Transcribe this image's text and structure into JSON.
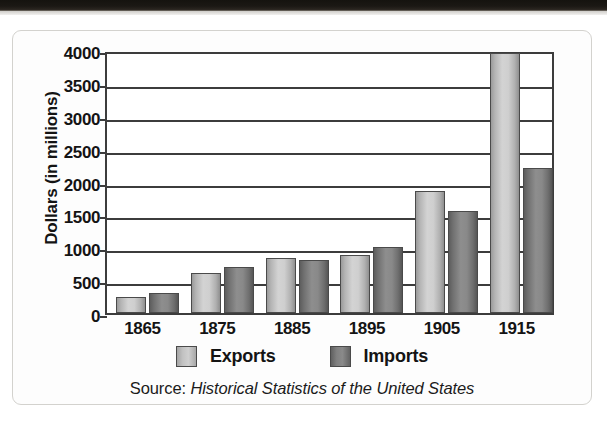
{
  "figure": {
    "y_axis_title": "Dollars (in millions)",
    "source_prefix": "Source:",
    "source_title": "Historical Statistics of the United States",
    "legend": [
      {
        "label": "Exports",
        "swatch": "exports-swatch",
        "color": "#c2c2c2"
      },
      {
        "label": "Imports",
        "swatch": "imports-swatch",
        "color": "#7d7d7d"
      }
    ]
  },
  "chart_data": {
    "type": "bar",
    "title": "",
    "subtitle": "",
    "xlabel": "",
    "ylabel": "Dollars (in millions)",
    "categories": [
      "1865",
      "1875",
      "1885",
      "1895",
      "1905",
      "1915"
    ],
    "series": [
      {
        "name": "Exports",
        "color": "#c2c2c2",
        "values": [
          250,
          610,
          830,
          880,
          1850,
          3950
        ]
      },
      {
        "name": "Imports",
        "color": "#7d7d7d",
        "values": [
          300,
          700,
          800,
          1000,
          1550,
          2200
        ]
      }
    ],
    "ylim": [
      0,
      4000
    ],
    "yticks": [
      0,
      500,
      1000,
      1500,
      2000,
      2500,
      3000,
      3500,
      4000
    ],
    "ytick_labels": [
      "0",
      "500",
      "1000",
      "1500",
      "2000",
      "2500",
      "3000",
      "3500",
      "4000"
    ],
    "grid": true,
    "grid_axis": "y",
    "legend_position": "bottom",
    "source": "Source: Historical Statistics of the United States"
  }
}
